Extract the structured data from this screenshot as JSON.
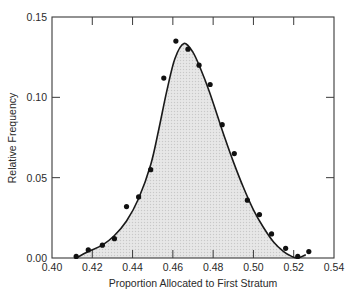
{
  "chart_data": {
    "type": "scatter",
    "title": "",
    "xlabel": "Proportion Allocated to First Stratum",
    "ylabel": "Relative Frequency",
    "xlim": [
      0.4,
      0.54
    ],
    "ylim": [
      0.0,
      0.15
    ],
    "xticks": [
      "0.40",
      "0.42",
      "0.44",
      "0.46",
      "0.48",
      "0.50",
      "0.52",
      "0.54"
    ],
    "yticks": [
      "0.00",
      "0.05",
      "0.10",
      "0.15"
    ],
    "grid": false,
    "legend": null,
    "series": [
      {
        "name": "observed relative frequency",
        "kind": "points",
        "x": [
          0.412,
          0.418,
          0.425,
          0.431,
          0.437,
          0.443,
          0.449,
          0.4555,
          0.4615,
          0.4675,
          0.473,
          0.4785,
          0.4845,
          0.4905,
          0.497,
          0.503,
          0.509,
          0.516,
          0.522,
          0.5275
        ],
        "y": [
          0.001,
          0.005,
          0.008,
          0.012,
          0.032,
          0.038,
          0.055,
          0.112,
          0.135,
          0.13,
          0.12,
          0.108,
          0.083,
          0.065,
          0.036,
          0.027,
          0.015,
          0.006,
          0.001,
          0.004
        ]
      },
      {
        "name": "fitted density curve (shaded)",
        "kind": "curve",
        "x": [
          0.412,
          0.418,
          0.425,
          0.431,
          0.437,
          0.443,
          0.449,
          0.453,
          0.457,
          0.461,
          0.4655,
          0.47,
          0.474,
          0.478,
          0.482,
          0.486,
          0.49,
          0.495,
          0.5,
          0.505,
          0.51,
          0.515,
          0.519,
          0.522,
          0.526
        ],
        "y": [
          0.0,
          0.004,
          0.008,
          0.014,
          0.023,
          0.037,
          0.058,
          0.08,
          0.104,
          0.124,
          0.1335,
          0.128,
          0.117,
          0.104,
          0.089,
          0.074,
          0.06,
          0.044,
          0.03,
          0.019,
          0.01,
          0.004,
          0.001,
          0.0,
          0.002
        ]
      }
    ]
  },
  "colors": {
    "axis": "#3a3a3a",
    "curve": "#1a1a1a",
    "points": "#111111",
    "fill": "#e4e4e4"
  }
}
